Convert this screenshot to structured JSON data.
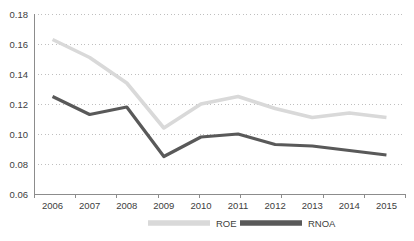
{
  "chart_data": {
    "type": "line",
    "title": "",
    "xlabel": "",
    "ylabel": "",
    "categories": [
      "2006",
      "2007",
      "2008",
      "2009",
      "2010",
      "2011",
      "2012",
      "2013",
      "2014",
      "2015"
    ],
    "x": [
      2006,
      2007,
      2008,
      2009,
      2010,
      2011,
      2012,
      2013,
      2014,
      2015
    ],
    "series": [
      {
        "name": "ROE",
        "color": "#d9d9d9",
        "values": [
          0.163,
          0.151,
          0.134,
          0.104,
          0.12,
          0.125,
          0.117,
          0.111,
          0.114,
          0.111
        ]
      },
      {
        "name": "RNOA",
        "color": "#595959",
        "values": [
          0.125,
          0.113,
          0.118,
          0.085,
          0.098,
          0.1,
          0.093,
          0.092,
          0.089,
          0.086
        ]
      }
    ],
    "ylim": [
      0.06,
      0.18
    ],
    "yticks": [
      0.06,
      0.08,
      0.1,
      0.12,
      0.14,
      0.16,
      0.18
    ],
    "ytick_labels": [
      "0.06",
      "0.08",
      "0.10",
      "0.12",
      "0.14",
      "0.16",
      "0.18"
    ],
    "xlim": [
      2006,
      2015
    ],
    "grid": "horizontal-dotted",
    "legend_position": "bottom"
  },
  "legend": {
    "items": [
      {
        "label": "ROE",
        "color": "#d9d9d9"
      },
      {
        "label": "RNOA",
        "color": "#595959"
      }
    ]
  },
  "layout": {
    "plot_left": 34,
    "plot_right": 405,
    "plot_top": 14,
    "plot_bottom": 194
  }
}
